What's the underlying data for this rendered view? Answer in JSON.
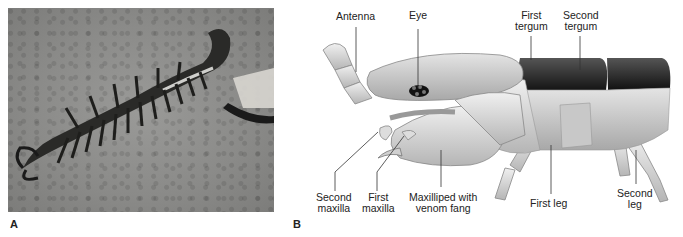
{
  "figure": {
    "panel_a": {
      "letter": "A",
      "description": "Photograph of a centipede on sandy ground"
    },
    "panel_b": {
      "letter": "B",
      "description": "Illustration of centipede head and anterior segments, lateral view",
      "labels": {
        "antenna": "Antenna",
        "eye": "Eye",
        "first_tergum_1": "First",
        "first_tergum_2": "tergum",
        "second_tergum_1": "Second",
        "second_tergum_2": "tergum",
        "second_maxilla_1": "Second",
        "second_maxilla_2": "maxilla",
        "first_maxilla_1": "First",
        "first_maxilla_2": "maxilla",
        "maxilliped_1": "Maxilliped with",
        "maxilliped_2": "venom fang",
        "first_leg": "First leg",
        "second_leg_1": "Second",
        "second_leg_2": "leg"
      }
    }
  }
}
